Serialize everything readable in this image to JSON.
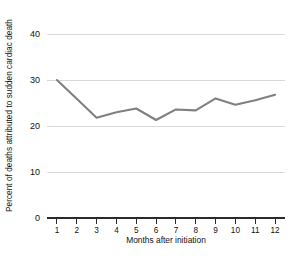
{
  "chart_data": {
    "type": "line",
    "title": "",
    "xlabel": "Months after initiation",
    "ylabel": "Percent of deaths attributed to sudden cardiac death",
    "x": [
      1,
      2,
      3,
      4,
      5,
      6,
      7,
      8,
      9,
      10,
      11,
      12
    ],
    "xtick_labels": [
      "1",
      "2",
      "3",
      "4",
      "5",
      "6",
      "7",
      "8",
      "9",
      "10",
      "11",
      "12"
    ],
    "values": [
      30.0,
      25.9,
      21.8,
      23.0,
      23.8,
      21.3,
      23.6,
      23.4,
      26.0,
      24.6,
      25.6,
      26.8
    ],
    "ytick_labels": [
      "0",
      "10",
      "20",
      "30",
      "40"
    ],
    "yticks": [
      0,
      10,
      20,
      30,
      40
    ],
    "ylim": [
      0,
      43
    ],
    "xlim": [
      0.5,
      12.5
    ],
    "grid": "horizontal",
    "legend": "none",
    "series_name": "Percent of deaths attributed to sudden cardiac death",
    "line_color": "#808080",
    "grid_color": "#d9d9d9",
    "axis_color": "#2b2b2b"
  }
}
